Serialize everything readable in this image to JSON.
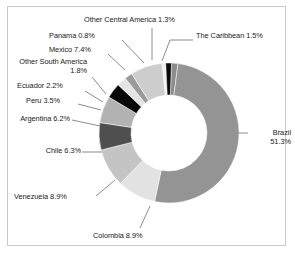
{
  "chart_data": {
    "type": "pie",
    "title": "",
    "subtitle": "",
    "xlabel": "",
    "ylabel": "",
    "donut": true,
    "legend_position": "none",
    "labels_style": "callout-with-leader-lines",
    "grid": false,
    "units": "percent",
    "categories": [
      "The Caribbean",
      "Brazil",
      "Colombia",
      "Venezuela",
      "Chile",
      "Argentina",
      "Peru",
      "Ecuador",
      "Other South America",
      "Mexico",
      "Panama",
      "Other Central America"
    ],
    "values": [
      1.5,
      51.3,
      8.9,
      8.9,
      6.3,
      6.2,
      3.5,
      2.2,
      1.8,
      7.4,
      0.8,
      1.3
    ],
    "slices": [
      {
        "label": "The Caribbean",
        "value": 1.5,
        "display": "The Caribbean  1.5%",
        "color": "#8c8c8c"
      },
      {
        "label": "Brazil",
        "value": 51.3,
        "display": "Brazil\n51.3%",
        "color": "#949494"
      },
      {
        "label": "Colombia",
        "value": 8.9,
        "display": "Colombia  8.9%",
        "color": "#e2e2e2"
      },
      {
        "label": "Venezuela",
        "value": 8.9,
        "display": "Venezuela  8.9%",
        "color": "#c4c4c4"
      },
      {
        "label": "Chile",
        "value": 6.3,
        "display": "Chile\n6.3%",
        "color": "#4f4f4f"
      },
      {
        "label": "Argentina",
        "value": 6.2,
        "display": "Argentina\n6.2%",
        "color": "#b2b2b2"
      },
      {
        "label": "Peru",
        "value": 3.5,
        "display": "Peru  3.5%",
        "color": "#080808"
      },
      {
        "label": "Ecuador",
        "value": 2.2,
        "display": "Ecuador  2.2%",
        "color": "#e4e4e4"
      },
      {
        "label": "Other South America",
        "value": 1.8,
        "display": "Other South America  1.8%",
        "color": "#9a9a9a"
      },
      {
        "label": "Mexico",
        "value": 7.4,
        "display": "Mexico  7.4%",
        "color": "#cdcdcd"
      },
      {
        "label": "Panama",
        "value": 0.8,
        "display": "Panama  0.8%",
        "color": "#f0f0f0"
      },
      {
        "label": "Other Central America",
        "value": 1.3,
        "display": "Other Central America  1.3%",
        "color": "#0a0a0a"
      }
    ]
  },
  "labels": {
    "other_central_america": "Other Central America  1.3%",
    "caribbean": "The Caribbean  1.5%",
    "panama": "Panama  0.8%",
    "mexico": "Mexico  7.4%",
    "other_south_america": "Other South America  1.8%",
    "ecuador": "Ecuador  2.2%",
    "peru": "Peru  3.5%",
    "argentina": "Argentina 6.2%",
    "chile": "Chile 6.3%",
    "venezuela": "Venezuela  8.9%",
    "colombia": "Colombia  8.9%",
    "brazil": "Brazil 51.3%"
  },
  "style": {
    "background": "#ffffff",
    "border_color": "#c9c9c9",
    "text_color": "#1a1a1a",
    "leader_line_color": "#6e6e6e"
  }
}
